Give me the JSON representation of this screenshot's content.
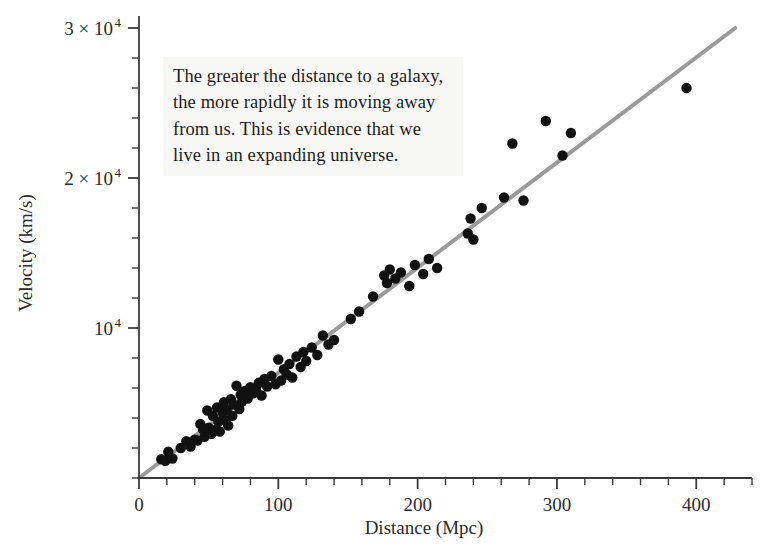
{
  "figure": {
    "background_color": "#ffffff",
    "point_color": "#111111",
    "line_color": "#9a9a9a",
    "axis_color": "#3a3a3a",
    "annotation_bg": "#f7f7f5"
  },
  "annotation": {
    "text": "The greater the distance to a galaxy, the more rapidly it is moving away from us. This is evidence that we live in an expanding universe."
  },
  "chart_data": {
    "type": "scatter",
    "title": "",
    "xlabel": "Distance (Mpc)",
    "ylabel": "Velocity (km/s)",
    "xlim": [
      0,
      440
    ],
    "ylim": [
      0,
      30800
    ],
    "grid": false,
    "legend": null,
    "x_ticks": [
      0,
      100,
      200,
      300,
      400
    ],
    "x_tick_labels": [
      "0",
      "100",
      "200",
      "300",
      "400"
    ],
    "x_minor_tick_step": 20,
    "y_ticks": [
      10000,
      20000,
      30000
    ],
    "y_tick_labels": [
      "10⁴",
      "2 × 10⁴",
      "3 × 10⁴"
    ],
    "y_tick_mantissa": [
      "",
      "2 × 10",
      "3 × 10"
    ],
    "y_minor_tick_step": 2000,
    "trendline": {
      "label": "Hubble law fit",
      "x": [
        0,
        428
      ],
      "y": [
        0,
        30000
      ],
      "slope_km_s_per_Mpc": 70.1,
      "intercept": 0,
      "color": "#9a9a9a",
      "width": 4
    },
    "series": [
      {
        "name": "Galaxies",
        "marker": "circle",
        "color": "#111111",
        "points": [
          [
            16,
            1250
          ],
          [
            19,
            1150
          ],
          [
            21,
            1750
          ],
          [
            24,
            1300
          ],
          [
            30,
            2000
          ],
          [
            34,
            2450
          ],
          [
            37,
            2100
          ],
          [
            40,
            2550
          ],
          [
            42,
            2500
          ],
          [
            44,
            3600
          ],
          [
            46,
            3250
          ],
          [
            47,
            2750
          ],
          [
            49,
            4500
          ],
          [
            50,
            3350
          ],
          [
            52,
            2950
          ],
          [
            53,
            4150
          ],
          [
            55,
            3200
          ],
          [
            56,
            4700
          ],
          [
            57,
            3750
          ],
          [
            58,
            3100
          ],
          [
            60,
            4350
          ],
          [
            61,
            5050
          ],
          [
            62,
            3850
          ],
          [
            63,
            4550
          ],
          [
            64,
            3500
          ],
          [
            66,
            5250
          ],
          [
            67,
            4150
          ],
          [
            68,
            4900
          ],
          [
            70,
            6150
          ],
          [
            72,
            4600
          ],
          [
            73,
            5550
          ],
          [
            74,
            5100
          ],
          [
            76,
            5800
          ],
          [
            78,
            5300
          ],
          [
            80,
            6050
          ],
          [
            82,
            5650
          ],
          [
            84,
            5950
          ],
          [
            86,
            6350
          ],
          [
            88,
            5500
          ],
          [
            90,
            6600
          ],
          [
            92,
            6100
          ],
          [
            95,
            6800
          ],
          [
            98,
            6250
          ],
          [
            100,
            7900
          ],
          [
            102,
            6500
          ],
          [
            104,
            7250
          ],
          [
            106,
            6900
          ],
          [
            108,
            7600
          ],
          [
            110,
            6700
          ],
          [
            113,
            8100
          ],
          [
            116,
            7400
          ],
          [
            118,
            8400
          ],
          [
            120,
            7800
          ],
          [
            124,
            8700
          ],
          [
            128,
            8200
          ],
          [
            132,
            9500
          ],
          [
            136,
            8900
          ],
          [
            140,
            9200
          ],
          [
            152,
            10600
          ],
          [
            158,
            11100
          ],
          [
            168,
            12100
          ],
          [
            176,
            13500
          ],
          [
            178,
            13000
          ],
          [
            180,
            13900
          ],
          [
            184,
            13300
          ],
          [
            188,
            13700
          ],
          [
            194,
            12800
          ],
          [
            198,
            14200
          ],
          [
            204,
            13600
          ],
          [
            208,
            14600
          ],
          [
            214,
            14000
          ],
          [
            236,
            16300
          ],
          [
            238,
            17300
          ],
          [
            240,
            15900
          ],
          [
            246,
            18000
          ],
          [
            262,
            18700
          ],
          [
            268,
            22300
          ],
          [
            276,
            18500
          ],
          [
            292,
            23800
          ],
          [
            304,
            21500
          ],
          [
            310,
            23000
          ],
          [
            393,
            26000
          ]
        ]
      }
    ]
  }
}
